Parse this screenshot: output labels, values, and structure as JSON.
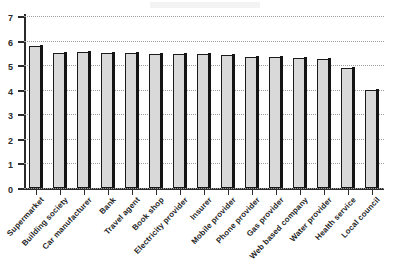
{
  "chart_data": {
    "type": "bar",
    "title": "",
    "xlabel": "",
    "ylabel": "",
    "ylim": [
      0,
      7
    ],
    "grid": true,
    "legend": false,
    "y_ticks": [
      "0",
      "1",
      "2",
      "3",
      "4",
      "5",
      "6",
      "7"
    ],
    "categories": [
      "Supermarket",
      "Building society",
      "Car manufacturer",
      "Bank",
      "Travel agent",
      "Book shop",
      "Electricity provider",
      "Insurer",
      "Mobile provider",
      "Phone provider",
      "Gas provider",
      "Web based company",
      "Water provider",
      "Health service",
      "Local council"
    ],
    "values": [
      5.8,
      5.5,
      5.55,
      5.5,
      5.5,
      5.45,
      5.45,
      5.45,
      5.4,
      5.35,
      5.35,
      5.3,
      5.25,
      4.9,
      4.0
    ]
  },
  "style": {
    "bar_fill": "#d9d9d9",
    "bar_outline": "#1a1a1a",
    "bar_shadow": "#141414",
    "axis_color": "#2b2b2b",
    "grid_color": "#b9b9b9",
    "background": "#ffffff"
  }
}
